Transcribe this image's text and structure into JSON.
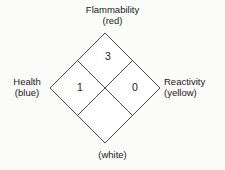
{
  "diagram": {
    "type": "nfpa-704-hazard-diamond",
    "quadrants": {
      "top": {
        "label": "Flammability",
        "color_name": "(red)",
        "color_hex": "#ff0000",
        "value": "3"
      },
      "left": {
        "label": "Health",
        "color_name": "(blue)",
        "color_hex": "#0000ff",
        "value": "1"
      },
      "right": {
        "label": "Reactivity",
        "color_name": "(yellow)",
        "color_hex": "#ffff00",
        "value": "0"
      },
      "bottom": {
        "label": "",
        "color_name": "(white)",
        "color_hex": "#ffffff",
        "value": ""
      }
    },
    "stroke_color": "#4a4a4a",
    "background_color": "#fbfbfa"
  }
}
